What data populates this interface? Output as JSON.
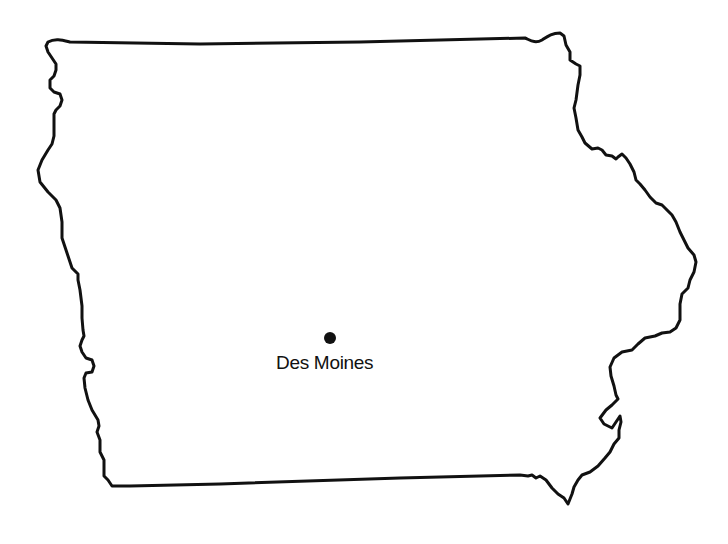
{
  "map": {
    "region": "Iowa",
    "outline_color": "#111111",
    "background": "#ffffff"
  },
  "cities": [
    {
      "name": "Des Moines",
      "marker": "dot",
      "x": 330,
      "y": 338
    }
  ]
}
